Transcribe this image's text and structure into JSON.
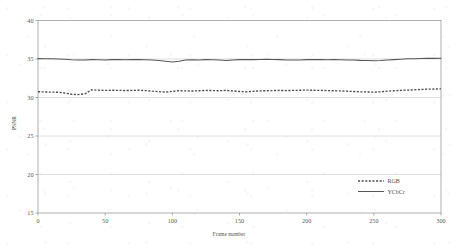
{
  "chart_data": {
    "type": "line",
    "title": "",
    "xlabel": "Frame number",
    "ylabel": "PSNR",
    "xlim": [
      0,
      300
    ],
    "ylim": [
      15,
      40
    ],
    "xticks": [
      0,
      50,
      100,
      150,
      200,
      250,
      300
    ],
    "yticks": [
      15,
      20,
      25,
      30,
      35,
      40
    ],
    "xtick_labels": [
      "0",
      "50",
      "100",
      "150",
      "200",
      "250",
      "300"
    ],
    "ytick_labels": [
      "15",
      "20",
      "25",
      "30",
      "35",
      "40"
    ],
    "grid": "horizontal",
    "legend_position": "lower-right",
    "x": [
      0,
      5,
      10,
      15,
      20,
      25,
      30,
      35,
      40,
      45,
      50,
      55,
      60,
      65,
      70,
      75,
      80,
      85,
      90,
      95,
      100,
      105,
      110,
      115,
      120,
      125,
      130,
      135,
      140,
      145,
      150,
      155,
      160,
      165,
      170,
      175,
      180,
      185,
      190,
      195,
      200,
      205,
      210,
      215,
      220,
      225,
      230,
      235,
      240,
      245,
      250,
      255,
      260,
      265,
      270,
      275,
      280,
      285,
      290,
      295,
      300
    ],
    "series": [
      {
        "name": "RGB",
        "style": "dashed",
        "color": "#4e4e4e",
        "values": [
          30.75,
          30.72,
          30.7,
          30.68,
          30.58,
          30.42,
          30.38,
          30.48,
          31.0,
          30.95,
          30.92,
          30.94,
          30.93,
          30.9,
          30.92,
          30.94,
          30.9,
          30.82,
          30.76,
          30.7,
          30.8,
          30.88,
          30.86,
          30.84,
          30.88,
          30.92,
          30.9,
          30.88,
          30.92,
          30.86,
          30.78,
          30.74,
          30.8,
          30.86,
          30.88,
          30.9,
          30.92,
          30.9,
          30.92,
          30.94,
          30.96,
          30.94,
          30.92,
          30.9,
          30.88,
          30.86,
          30.82,
          30.78,
          30.74,
          30.72,
          30.7,
          30.74,
          30.82,
          30.88,
          30.92,
          30.96,
          31.0,
          31.04,
          31.08,
          31.1,
          31.12
        ]
      },
      {
        "name": "YCbCr",
        "style": "solid",
        "color": "#575757",
        "values": [
          35.05,
          35.04,
          35.02,
          35.0,
          34.96,
          34.9,
          34.86,
          34.88,
          34.92,
          34.9,
          34.88,
          34.92,
          34.94,
          34.9,
          34.92,
          34.94,
          34.9,
          34.86,
          34.8,
          34.7,
          34.62,
          34.72,
          34.86,
          34.9,
          34.88,
          34.92,
          34.9,
          34.86,
          34.8,
          34.86,
          34.92,
          34.94,
          34.92,
          34.94,
          34.96,
          34.94,
          34.92,
          34.88,
          34.86,
          34.88,
          34.92,
          34.94,
          34.92,
          34.9,
          34.92,
          34.9,
          34.88,
          34.86,
          34.82,
          34.8,
          34.78,
          34.8,
          34.86,
          34.92,
          34.98,
          35.02,
          35.04,
          35.06,
          35.08,
          35.08,
          35.1
        ]
      }
    ],
    "legend": [
      {
        "label": "RGB",
        "style": "dashed"
      },
      {
        "label": "YCbCr",
        "style": "solid"
      }
    ]
  }
}
